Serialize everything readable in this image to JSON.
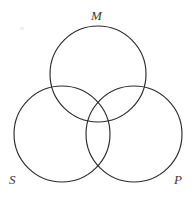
{
  "figure": {
    "type": "venn-diagram-three-circle",
    "background_color": "#ffffff",
    "stroke_color": "#2b2b2b",
    "label_color": "#3a3a3a",
    "canvas": {
      "width": 194,
      "height": 197
    }
  },
  "labels": {
    "top": "M",
    "bottom_left": "S",
    "bottom_right": "P"
  },
  "circles": [
    {
      "name": "M",
      "cx": 98,
      "cy": 74,
      "r": 48
    },
    {
      "name": "S",
      "cx": 62,
      "cy": 134,
      "r": 48
    },
    {
      "name": "P",
      "cx": 134,
      "cy": 134,
      "r": 48
    }
  ]
}
